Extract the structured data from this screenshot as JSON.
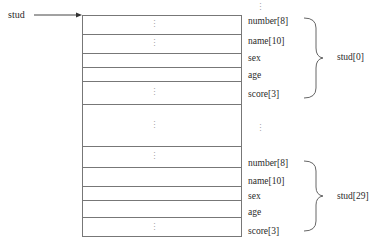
{
  "pointer": {
    "label": "stud"
  },
  "fields": [
    "number[8]",
    "name[10]",
    "sex",
    "age",
    "score[3]"
  ],
  "groups": [
    {
      "label": "stud[0]",
      "fields": [
        "number[8]",
        "name[10]",
        "sex",
        "age",
        "score[3]"
      ]
    },
    {
      "label": "stud[29]",
      "fields": [
        "number[8]",
        "name[10]",
        "sex",
        "age",
        "score[3]"
      ]
    }
  ],
  "ellipsis": "⋮",
  "colors": {
    "line": "#777777",
    "text": "#2a2a2a",
    "dots": "#888888"
  }
}
